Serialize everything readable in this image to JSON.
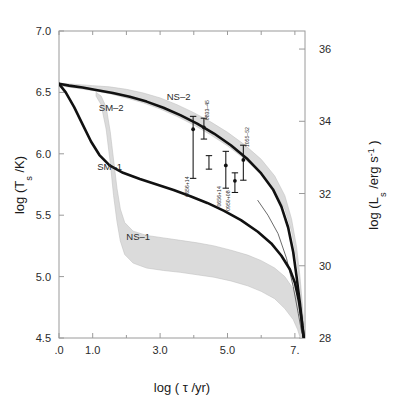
{
  "figure": {
    "background_color": "#ffffff",
    "band_color": "#d9d9d9",
    "curve_color": "#111111"
  },
  "chart_data": {
    "type": "line",
    "title": "",
    "xlabel": "log ( τ /yr)",
    "ylabel_left": "log (T",
    "ylabel_left_sub": "s",
    "ylabel_left_tail": " /K)",
    "ylabel_right": "log (L",
    "ylabel_right_sub": "s",
    "ylabel_right_tail": " /erg s",
    "ylabel_right_exp": "-1",
    "ylabel_right_close": " )",
    "xlim": [
      0.0,
      7.3
    ],
    "ylim_left": [
      4.5,
      7.0
    ],
    "ylim_right": [
      28,
      36.5
    ],
    "grid": false,
    "legend_position": "inline-annotations",
    "xticks": [
      ".0",
      "1.0",
      "3.0",
      "5.0",
      "7."
    ],
    "xtick_values": [
      0.0,
      1.0,
      3.0,
      5.0,
      7.0
    ],
    "xminor_values": [
      2.0,
      4.0,
      6.0
    ],
    "yticks_left": [
      "7.0",
      "6.5",
      "6.0",
      "5.5",
      "5.0",
      "4.5"
    ],
    "ytick_left_values": [
      7.0,
      6.5,
      6.0,
      5.5,
      5.0,
      4.5
    ],
    "yticks_right": [
      "36",
      "34",
      "32",
      "30",
      "28"
    ],
    "ytick_right_values": [
      36,
      34,
      32,
      30,
      28
    ],
    "series": [
      {
        "name": "SM-2",
        "label": "SM–2",
        "label_x": 1.55,
        "label_y": 6.35,
        "style": "thick-black",
        "points": [
          [
            0.0,
            6.57
          ],
          [
            0.3,
            6.555
          ],
          [
            0.7,
            6.54
          ],
          [
            1.1,
            6.52
          ],
          [
            1.6,
            6.495
          ],
          [
            2.1,
            6.465
          ],
          [
            2.6,
            6.425
          ],
          [
            3.1,
            6.375
          ],
          [
            3.6,
            6.315
          ],
          [
            4.1,
            6.245
          ],
          [
            4.6,
            6.165
          ],
          [
            5.1,
            6.07
          ],
          [
            5.6,
            5.955
          ],
          [
            6.0,
            5.84
          ],
          [
            6.35,
            5.71
          ],
          [
            6.6,
            5.57
          ],
          [
            6.8,
            5.4
          ],
          [
            6.95,
            5.2
          ],
          [
            7.05,
            5.0
          ],
          [
            7.15,
            4.78
          ],
          [
            7.22,
            4.6
          ],
          [
            7.27,
            4.5
          ]
        ]
      },
      {
        "name": "SM-1",
        "label": "SM–1",
        "label_x": 1.5,
        "label_y": 5.87,
        "style": "thick-black",
        "points": [
          [
            0.0,
            6.57
          ],
          [
            0.2,
            6.5
          ],
          [
            0.45,
            6.38
          ],
          [
            0.7,
            6.24
          ],
          [
            0.95,
            6.1
          ],
          [
            1.2,
            5.99
          ],
          [
            1.5,
            5.905
          ],
          [
            1.9,
            5.845
          ],
          [
            2.4,
            5.795
          ],
          [
            2.9,
            5.75
          ],
          [
            3.4,
            5.705
          ],
          [
            3.9,
            5.655
          ],
          [
            4.4,
            5.6
          ],
          [
            4.9,
            5.535
          ],
          [
            5.4,
            5.46
          ],
          [
            5.9,
            5.365
          ],
          [
            6.3,
            5.27
          ],
          [
            6.6,
            5.17
          ],
          [
            6.85,
            5.06
          ],
          [
            7.0,
            4.95
          ],
          [
            7.12,
            4.8
          ],
          [
            7.2,
            4.65
          ],
          [
            7.26,
            4.5
          ]
        ]
      },
      {
        "name": "NS-2",
        "label": "NS–2",
        "label_x": 3.55,
        "label_y": 6.44,
        "style": "band",
        "band_upper": [
          [
            0.0,
            6.575
          ],
          [
            0.5,
            6.565
          ],
          [
            1.0,
            6.555
          ],
          [
            1.5,
            6.545
          ],
          [
            2.0,
            6.525
          ],
          [
            2.5,
            6.495
          ],
          [
            3.0,
            6.455
          ],
          [
            3.5,
            6.4
          ],
          [
            4.0,
            6.335
          ],
          [
            4.5,
            6.26
          ],
          [
            5.0,
            6.175
          ],
          [
            5.5,
            6.075
          ],
          [
            6.0,
            5.955
          ],
          [
            6.4,
            5.82
          ],
          [
            6.7,
            5.66
          ],
          [
            6.9,
            5.47
          ],
          [
            7.05,
            5.24
          ],
          [
            7.15,
            5.0
          ],
          [
            7.22,
            4.78
          ],
          [
            7.28,
            4.55
          ]
        ],
        "band_lower": [
          [
            0.0,
            6.555
          ],
          [
            0.5,
            6.535
          ],
          [
            1.0,
            6.515
          ],
          [
            1.5,
            6.49
          ],
          [
            2.0,
            6.455
          ],
          [
            2.5,
            6.415
          ],
          [
            3.0,
            6.365
          ],
          [
            3.5,
            6.305
          ],
          [
            4.0,
            6.235
          ],
          [
            4.5,
            6.155
          ],
          [
            5.0,
            6.065
          ],
          [
            5.5,
            5.96
          ],
          [
            6.0,
            5.835
          ],
          [
            6.4,
            5.7
          ],
          [
            6.7,
            5.55
          ],
          [
            6.9,
            5.37
          ],
          [
            7.05,
            5.14
          ],
          [
            7.15,
            4.92
          ],
          [
            7.22,
            4.71
          ],
          [
            7.28,
            4.5
          ]
        ]
      },
      {
        "name": "NS-1",
        "label": "NS–1",
        "label_x": 2.35,
        "label_y": 5.3,
        "style": "band",
        "band_upper": [
          [
            1.1,
            6.5
          ],
          [
            1.25,
            6.47
          ],
          [
            1.4,
            6.38
          ],
          [
            1.52,
            6.18
          ],
          [
            1.62,
            5.95
          ],
          [
            1.72,
            5.72
          ],
          [
            1.82,
            5.55
          ],
          [
            1.95,
            5.44
          ],
          [
            2.2,
            5.37
          ],
          [
            2.6,
            5.335
          ],
          [
            3.1,
            5.315
          ],
          [
            3.6,
            5.295
          ],
          [
            4.1,
            5.275
          ],
          [
            4.6,
            5.25
          ],
          [
            5.1,
            5.215
          ],
          [
            5.6,
            5.175
          ],
          [
            6.0,
            5.13
          ],
          [
            6.4,
            5.07
          ],
          [
            6.7,
            5.0
          ],
          [
            6.95,
            4.9
          ],
          [
            7.1,
            4.78
          ],
          [
            7.22,
            4.62
          ],
          [
            7.28,
            4.5
          ]
        ],
        "band_lower": [
          [
            1.1,
            6.47
          ],
          [
            1.25,
            6.4
          ],
          [
            1.4,
            6.2
          ],
          [
            1.52,
            5.93
          ],
          [
            1.62,
            5.66
          ],
          [
            1.72,
            5.45
          ],
          [
            1.82,
            5.29
          ],
          [
            1.95,
            5.18
          ],
          [
            2.2,
            5.11
          ],
          [
            2.6,
            5.07
          ],
          [
            3.1,
            5.05
          ],
          [
            3.6,
            5.035
          ],
          [
            4.1,
            5.015
          ],
          [
            4.6,
            4.995
          ],
          [
            5.1,
            4.965
          ],
          [
            5.6,
            4.925
          ],
          [
            6.0,
            4.88
          ],
          [
            6.4,
            4.82
          ],
          [
            6.7,
            4.74
          ],
          [
            6.95,
            4.65
          ],
          [
            7.08,
            4.57
          ],
          [
            7.16,
            4.5
          ]
        ]
      }
    ],
    "extra_curves": [
      {
        "name": "thin-tail-lower",
        "points": [
          [
            5.9,
            5.62
          ],
          [
            6.2,
            5.5
          ],
          [
            6.5,
            5.35
          ],
          [
            6.75,
            5.15
          ],
          [
            6.95,
            4.92
          ],
          [
            7.1,
            4.7
          ],
          [
            7.2,
            4.55
          ],
          [
            7.26,
            4.5
          ]
        ]
      }
    ],
    "data_points": [
      {
        "label": "0833–45",
        "x": 4.3,
        "y": 6.215,
        "y_err_up": 0.075,
        "y_err_down": 0.095,
        "label_rotated": true,
        "label_anchor": "right"
      },
      {
        "label": "0656+14",
        "x": 3.98,
        "y": 6.2,
        "y_err_up": 0.105,
        "y_err_down": 0.4,
        "label_rotated": true,
        "label_anchor": "left"
      },
      {
        "label": "",
        "x": 4.45,
        "y": 5.93,
        "y_err_up": 0.055,
        "y_err_down": 0.055,
        "label_rotated": true,
        "label_anchor": "none"
      },
      {
        "label": "0656+14",
        "x": 4.95,
        "y": 5.905,
        "y_err_up": 0.115,
        "y_err_down": 0.185,
        "label_rotated": true,
        "label_anchor": "left"
      },
      {
        "label": "0950+08",
        "x": 5.22,
        "y": 5.78,
        "y_err_up": 0.065,
        "y_err_down": 0.095,
        "label_rotated": true,
        "label_anchor": "left"
      },
      {
        "label": "1055–52",
        "x": 5.47,
        "y": 5.95,
        "y_err_up": 0.12,
        "y_err_down": 0.165,
        "label_rotated": true,
        "label_anchor": "right"
      }
    ]
  }
}
